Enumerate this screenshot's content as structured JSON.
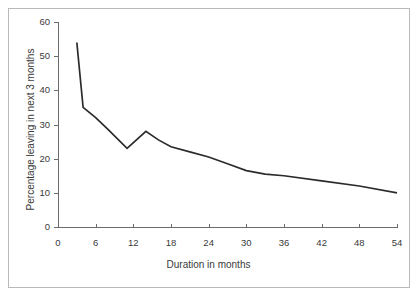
{
  "chart_data": {
    "type": "line",
    "title": "",
    "xlabel": "Duration in months",
    "ylabel": "Percentage leaving in next 3 months",
    "xlim": [
      -3,
      57
    ],
    "ylim": [
      0,
      60
    ],
    "grid": false,
    "legend": null,
    "xticks": [
      0,
      6,
      12,
      18,
      24,
      30,
      36,
      42,
      48,
      54
    ],
    "xtick_labels": [
      "0",
      "6",
      "12",
      "18",
      "24",
      "30",
      "36",
      "42",
      "48",
      "54"
    ],
    "yticks": [
      0,
      10,
      20,
      30,
      40,
      50,
      60
    ],
    "ytick_labels": [
      "0",
      "10",
      "20",
      "30",
      "40",
      "50",
      "60"
    ],
    "series": [
      {
        "name": "Percentage leaving in next 3 months",
        "color": "#2b2b2b",
        "x": [
          3,
          4,
          6,
          8,
          11,
          14,
          16,
          18,
          21,
          24,
          27,
          30,
          33,
          36,
          42,
          48,
          54
        ],
        "y": [
          54,
          35,
          32,
          28.5,
          23,
          28,
          25.5,
          23.5,
          22,
          20.5,
          18.5,
          16.5,
          15.5,
          15,
          13.5,
          12,
          10
        ]
      }
    ]
  },
  "axes": {
    "axis_color": "#6b6b6b",
    "frame_color": "#b9b9b9",
    "background": "#ffffff"
  }
}
